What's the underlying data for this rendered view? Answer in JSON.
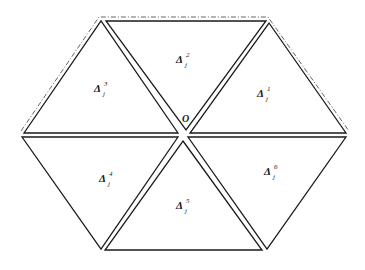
{
  "diagram": {
    "type": "hexagon-triangulation",
    "center_label": "O",
    "triangles": [
      {
        "id": 1,
        "symbol": "Δ",
        "sub": "j",
        "sup": "1",
        "position": "upper-right"
      },
      {
        "id": 2,
        "symbol": "Δ",
        "sub": "j",
        "sup": "2",
        "position": "top"
      },
      {
        "id": 3,
        "symbol": "Δ",
        "sub": "j",
        "sup": "3",
        "position": "upper-left"
      },
      {
        "id": 4,
        "symbol": "Δ",
        "sub": "j",
        "sup": "4",
        "position": "lower-left"
      },
      {
        "id": 5,
        "symbol": "Δ",
        "sub": "j",
        "sup": "5",
        "position": "bottom"
      },
      {
        "id": 6,
        "symbol": "Δ",
        "sub": "j",
        "sup": "6",
        "position": "lower-right"
      }
    ],
    "outline": {
      "style": "dash-dot",
      "edges": [
        "upper-left",
        "top",
        "upper-right"
      ]
    },
    "colors": {
      "stroke": "#1a1a1a",
      "outline": "#555555",
      "background": "#ffffff"
    }
  }
}
